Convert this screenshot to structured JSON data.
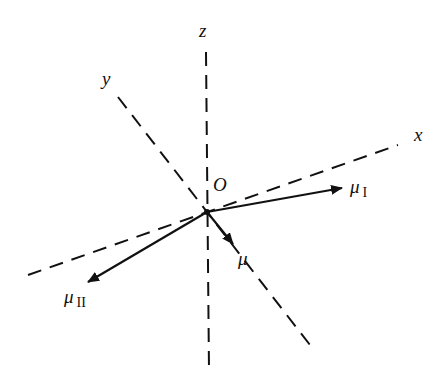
{
  "diagram": {
    "axes": [
      {
        "name": "x",
        "label": "x"
      },
      {
        "name": "y",
        "label": "y"
      },
      {
        "name": "z",
        "label": "z"
      }
    ],
    "origin_label": "O",
    "vectors": [
      {
        "name": "mu-I",
        "symbol": "μ",
        "subscript": "I"
      },
      {
        "name": "mu-II",
        "symbol": "μ",
        "subscript": "II"
      },
      {
        "name": "mu",
        "symbol": "μ",
        "subscript": ""
      }
    ],
    "colors": {
      "line": "#111111",
      "background": "#ffffff"
    }
  }
}
